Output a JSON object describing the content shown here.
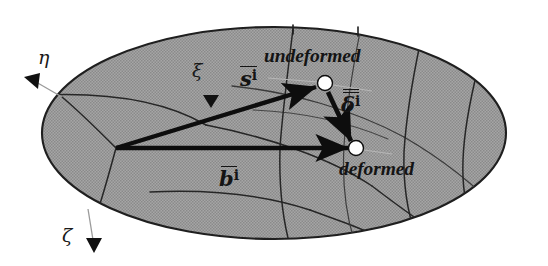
{
  "figure": {
    "kind": "mechanics-diagram",
    "background_color": "#ffffff",
    "surface_fill_color": "#9b9b9b",
    "surface_outline_color": "#1a1a1a",
    "grid_line_color": "#2b2b2b",
    "vector_color": "#0d0d0d",
    "node_fill_color": "#ffffff",
    "node_stroke_color": "#0d0d0d"
  },
  "axes": [
    {
      "id": "eta",
      "symbol": "η",
      "name": "eta-axis-label",
      "label_x": 38,
      "label_y": 48,
      "arrow_tip_x": 30,
      "arrow_tip_y": 80,
      "leader_from_x": 62,
      "leader_from_y": 97,
      "direction": "down-left"
    },
    {
      "id": "xi",
      "symbol": "ξ",
      "name": "xi-axis-label",
      "label_x": 192,
      "label_y": 61,
      "arrow_tip_x": 207,
      "arrow_tip_y": 101,
      "leader_from_x": 232,
      "leader_from_y": 88,
      "direction": "down"
    },
    {
      "id": "zeta",
      "symbol": "ζ",
      "name": "zeta-axis-label",
      "label_x": 62,
      "label_y": 226,
      "arrow_tip_x": 93,
      "arrow_tip_y": 250,
      "leader_from_x": 88,
      "leader_from_y": 209,
      "direction": "down"
    }
  ],
  "nodes": [
    {
      "id": "undeformed",
      "label": "undeformed",
      "label_x": 264,
      "label_y": 46,
      "x": 325,
      "y": 83,
      "radius": 7.5
    },
    {
      "id": "deformed",
      "label": "deformed",
      "label_x": 339,
      "label_y": 159,
      "x": 356,
      "y": 148,
      "radius": 7.5
    }
  ],
  "vectors": [
    {
      "id": "s",
      "symbol": "s",
      "prime": "i",
      "overbar": "single",
      "label_x": 240,
      "label_y": 66,
      "from_x": 116,
      "from_y": 148,
      "to_x": 321,
      "to_y": 86,
      "description": "position vector to undeformed node"
    },
    {
      "id": "delta",
      "symbol": "δ",
      "prime": "i",
      "overbar": "double",
      "label_x": 341,
      "label_y": 89,
      "from_x": 328,
      "from_y": 91,
      "to_x": 352,
      "to_y": 143,
      "description": "displacement vector from undeformed to deformed node"
    },
    {
      "id": "b",
      "symbol": "b",
      "prime": "i",
      "overbar": "single",
      "label_x": 219,
      "label_y": 166,
      "from_x": 116,
      "from_y": 148,
      "to_x": 352,
      "to_y": 148,
      "description": "position vector to deformed node"
    }
  ],
  "surface": {
    "ellipse_center_x": 274,
    "ellipse_center_y": 133,
    "ellipse_radius_x": 232,
    "ellipse_radius_y": 106
  }
}
